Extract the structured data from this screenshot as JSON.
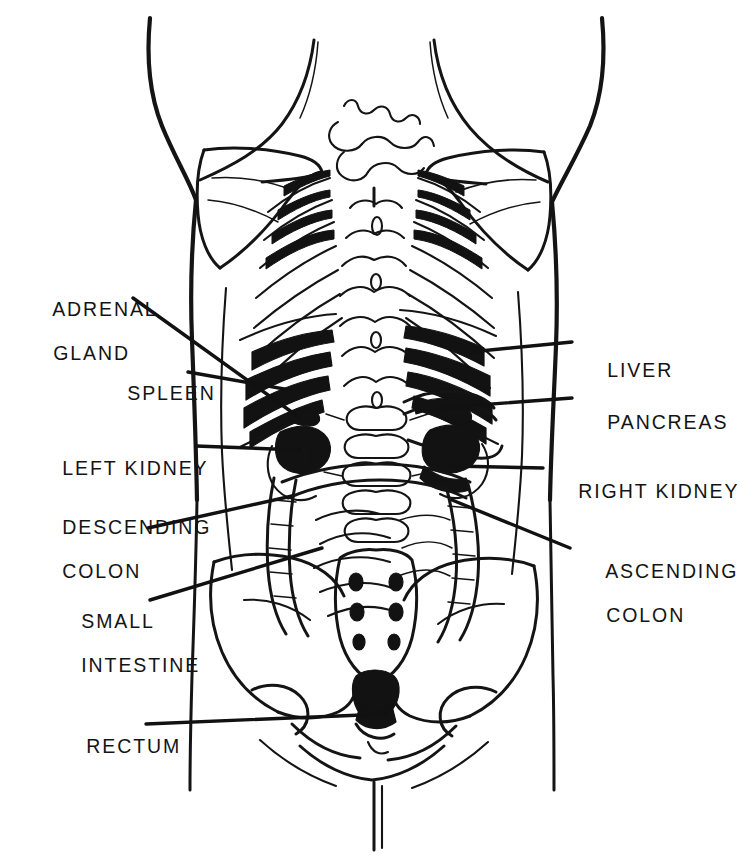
{
  "figure": {
    "background_color": "#ffffff",
    "ink_color": "#141414",
    "width": 739,
    "height": 859
  },
  "labels": {
    "left": [
      {
        "id": "adrenal-gland",
        "line1": "ADRENAL",
        "line2": "GLAND",
        "x": 24,
        "y": 276
      },
      {
        "id": "spleen",
        "line1": "SPLEEN",
        "line2": "",
        "x": 98,
        "y": 360
      },
      {
        "id": "left-kidney",
        "line1": "LEFT KIDNEY",
        "line2": "",
        "x": 33,
        "y": 435
      },
      {
        "id": "descending-colon",
        "line1": "DESCENDING",
        "line2": "COLON",
        "x": 33,
        "y": 494
      },
      {
        "id": "small-intestine",
        "line1": "SMALL",
        "line2": "INTESTINE",
        "x": 52,
        "y": 588
      },
      {
        "id": "rectum",
        "line1": "RECTUM",
        "line2": "",
        "x": 57,
        "y": 713
      }
    ],
    "right": [
      {
        "id": "liver",
        "line1": "LIVER",
        "line2": "",
        "x": 578,
        "y": 337
      },
      {
        "id": "pancreas",
        "line1": "PANCREAS",
        "line2": "",
        "x": 578,
        "y": 389
      },
      {
        "id": "right-kidney",
        "line1": "RIGHT KIDNEY",
        "line2": "",
        "x": 549,
        "y": 458
      },
      {
        "id": "ascending-colon",
        "line1": "ASCENDING",
        "line2": "COLON",
        "x": 577,
        "y": 538
      }
    ]
  },
  "caption": {
    "text": "",
    "visible": false
  }
}
